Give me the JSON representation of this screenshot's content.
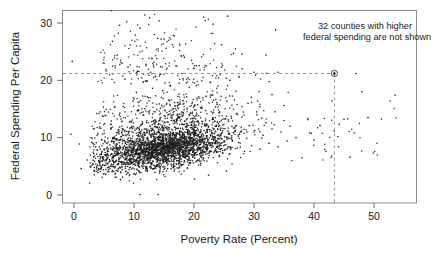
{
  "chart_data": {
    "type": "scatter",
    "title": "",
    "xlabel": "Poverty Rate (Percent)",
    "ylabel": "Federal Spending Per Capita",
    "xlim": [
      -2.0,
      57.2
    ],
    "ylim": [
      -1.4,
      33.6
    ],
    "xticks": [
      0,
      10,
      20,
      30,
      40,
      50
    ],
    "xtick_labels": [
      "0",
      "10",
      "20",
      "30",
      "40",
      "50"
    ],
    "yticks": [
      0,
      10,
      20,
      30
    ],
    "ytick_labels": [
      "0",
      "10",
      "20",
      "30"
    ],
    "grid": false,
    "legend": null,
    "annotations": [
      {
        "name": "truncation-note",
        "lines": [
          "32 counties with higher",
          "federal spending are not shown"
        ],
        "x": 33.0,
        "y": 31.5,
        "align": "left"
      }
    ],
    "reference_lines": [
      {
        "name": "horizontal-reference",
        "orientation": "horizontal",
        "value": 21.2,
        "style": "dashed",
        "from_x": -2.0,
        "to_x": 43.4
      },
      {
        "name": "vertical-reference",
        "orientation": "vertical",
        "value": 43.4,
        "style": "dashed",
        "from_y": -1.4,
        "to_y": 21.2
      }
    ],
    "highlighted_point": {
      "name": "circled-county",
      "x": 43.4,
      "y": 21.2,
      "marker": "circled-dot"
    },
    "marker": {
      "shape": "dot",
      "size_px": 1.6,
      "color": "#1c1c1c"
    },
    "n_points_shown": 3050,
    "points": [
      [
        -0.3,
        23.3
      ],
      [
        -0.5,
        10.6
      ],
      [
        0.9,
        8.9
      ],
      [
        1.2,
        4.6
      ],
      [
        2.2,
        6.1
      ],
      [
        2.6,
        2.1
      ],
      [
        3.1,
        5.4
      ],
      [
        3.3,
        7.2
      ],
      [
        3.4,
        4.2
      ],
      [
        3.6,
        6.4
      ],
      [
        3.7,
        9.1
      ],
      [
        3.8,
        5.0
      ],
      [
        3.9,
        7.8
      ],
      [
        4.0,
        3.9
      ],
      [
        4.1,
        6.0
      ],
      [
        4.2,
        8.4
      ],
      [
        4.3,
        5.6
      ],
      [
        4.4,
        4.1
      ],
      [
        4.5,
        7.0
      ],
      [
        4.6,
        9.6
      ],
      [
        4.7,
        5.9
      ],
      [
        4.8,
        6.6
      ],
      [
        4.9,
        4.4
      ],
      [
        5.0,
        8.0
      ],
      [
        5.1,
        5.2
      ],
      [
        5.2,
        7.4
      ],
      [
        5.3,
        3.6
      ],
      [
        5.4,
        6.8
      ],
      [
        5.5,
        9.0
      ],
      [
        5.6,
        5.5
      ],
      [
        5.7,
        7.6
      ],
      [
        5.8,
        4.8
      ],
      [
        5.9,
        6.2
      ],
      [
        6.0,
        8.7
      ],
      [
        6.1,
        5.1
      ],
      [
        6.2,
        7.1
      ],
      [
        6.3,
        9.4
      ],
      [
        6.4,
        4.3
      ],
      [
        6.5,
        6.5
      ],
      [
        6.6,
        8.1
      ],
      [
        6.7,
        5.7
      ],
      [
        6.8,
        7.3
      ],
      [
        6.9,
        3.8
      ],
      [
        7.0,
        6.9
      ],
      [
        7.1,
        9.8
      ],
      [
        7.2,
        5.3
      ],
      [
        7.3,
        7.9
      ],
      [
        7.4,
        4.6
      ],
      [
        7.5,
        6.3
      ],
      [
        7.6,
        8.6
      ],
      [
        7.7,
        5.8
      ],
      [
        7.8,
        7.5
      ],
      [
        7.9,
        10.2
      ],
      [
        8.0,
        4.9
      ],
      [
        8.1,
        6.7
      ],
      [
        8.2,
        8.3
      ],
      [
        8.3,
        5.4
      ],
      [
        8.4,
        7.2
      ],
      [
        8.5,
        9.2
      ],
      [
        8.6,
        4.1
      ],
      [
        8.7,
        6.1
      ],
      [
        8.8,
        8.8
      ],
      [
        8.9,
        5.6
      ],
      [
        9.0,
        7.7
      ],
      [
        9.1,
        10.8
      ],
      [
        9.2,
        4.4
      ],
      [
        9.3,
        6.4
      ],
      [
        9.4,
        8.2
      ],
      [
        9.5,
        5.9
      ],
      [
        9.6,
        7.0
      ],
      [
        9.7,
        9.5
      ],
      [
        9.8,
        4.7
      ],
      [
        9.9,
        6.6
      ],
      [
        10.0,
        8.5
      ],
      [
        10.2,
        5.2
      ],
      [
        10.4,
        7.4
      ],
      [
        10.6,
        9.9
      ],
      [
        10.8,
        4.2
      ],
      [
        11.0,
        6.8
      ],
      [
        11.2,
        8.0
      ],
      [
        11.4,
        5.5
      ],
      [
        11.6,
        7.6
      ],
      [
        11.8,
        10.4
      ],
      [
        12.0,
        4.8
      ],
      [
        12.2,
        6.2
      ],
      [
        12.4,
        8.9
      ],
      [
        12.6,
        5.7
      ],
      [
        12.8,
        7.1
      ],
      [
        13.0,
        9.3
      ],
      [
        13.2,
        4.5
      ],
      [
        13.4,
        6.5
      ],
      [
        13.6,
        8.4
      ],
      [
        13.8,
        5.1
      ],
      [
        14.0,
        7.8
      ],
      [
        14.2,
        10.1
      ],
      [
        14.4,
        4.9
      ],
      [
        14.6,
        6.9
      ],
      [
        14.8,
        8.6
      ],
      [
        15.0,
        5.8
      ],
      [
        15.2,
        7.3
      ],
      [
        15.4,
        9.7
      ],
      [
        15.6,
        4.6
      ],
      [
        15.8,
        6.3
      ],
      [
        16.0,
        8.1
      ],
      [
        16.2,
        5.4
      ],
      [
        16.4,
        7.9
      ],
      [
        16.6,
        10.6
      ],
      [
        16.8,
        5.0
      ],
      [
        17.0,
        7.2
      ],
      [
        17.2,
        9.1
      ],
      [
        17.4,
        6.0
      ],
      [
        17.6,
        8.3
      ],
      [
        17.8,
        11.0
      ],
      [
        18.0,
        5.3
      ],
      [
        18.2,
        7.5
      ],
      [
        18.4,
        9.4
      ],
      [
        18.6,
        6.4
      ],
      [
        18.8,
        8.7
      ],
      [
        19.0,
        11.4
      ],
      [
        19.2,
        5.6
      ],
      [
        19.4,
        7.7
      ],
      [
        19.6,
        9.8
      ],
      [
        19.8,
        6.7
      ],
      [
        20.0,
        8.9
      ],
      [
        20.3,
        11.8
      ],
      [
        20.6,
        6.1
      ],
      [
        20.9,
        8.2
      ],
      [
        21.2,
        10.3
      ],
      [
        21.5,
        7.0
      ],
      [
        21.8,
        9.2
      ],
      [
        22.1,
        12.2
      ],
      [
        22.4,
        6.5
      ],
      [
        22.7,
        8.6
      ],
      [
        23.0,
        10.8
      ],
      [
        23.3,
        7.4
      ],
      [
        23.6,
        9.6
      ],
      [
        23.9,
        12.7
      ],
      [
        24.2,
        6.9
      ],
      [
        24.5,
        9.0
      ],
      [
        24.8,
        11.2
      ],
      [
        25.1,
        7.8
      ],
      [
        25.4,
        10.1
      ],
      [
        25.7,
        13.1
      ],
      [
        26.0,
        7.2
      ],
      [
        26.4,
        9.5
      ],
      [
        26.8,
        11.7
      ],
      [
        27.2,
        8.2
      ],
      [
        27.6,
        10.6
      ],
      [
        28.0,
        13.6
      ],
      [
        28.4,
        7.6
      ],
      [
        28.8,
        9.9
      ],
      [
        29.2,
        12.1
      ],
      [
        29.6,
        8.6
      ],
      [
        30.0,
        11.0
      ],
      [
        30.5,
        14.0
      ],
      [
        31.0,
        8.0
      ],
      [
        31.5,
        10.4
      ],
      [
        32.0,
        12.6
      ],
      [
        32.5,
        9.0
      ],
      [
        33.0,
        11.5
      ],
      [
        33.5,
        14.5
      ],
      [
        34.0,
        8.4
      ],
      [
        34.5,
        11.0
      ],
      [
        35.0,
        13.0
      ],
      [
        35.5,
        9.4
      ],
      [
        36.0,
        12.0
      ],
      [
        37.0,
        10.0
      ],
      [
        38.0,
        6.5
      ],
      [
        39.0,
        13.3
      ],
      [
        40.0,
        9.6
      ],
      [
        41.0,
        12.1
      ],
      [
        42.0,
        7.6
      ],
      [
        43.0,
        16.4
      ],
      [
        43.4,
        21.2
      ],
      [
        44.0,
        10.2
      ],
      [
        45.0,
        13.2
      ],
      [
        46.0,
        6.6
      ],
      [
        47.0,
        21.2
      ],
      [
        48.0,
        18.0
      ],
      [
        49.0,
        13.5
      ],
      [
        53.5,
        17.4
      ],
      [
        11.0,
        0.1
      ],
      [
        14.0,
        0.1
      ],
      [
        8.5,
        20.2
      ],
      [
        9.5,
        19.4
      ],
      [
        12.2,
        19.9
      ],
      [
        13.1,
        18.6
      ],
      [
        10.4,
        17.9
      ],
      [
        14.8,
        18.2
      ],
      [
        16.0,
        19.1
      ],
      [
        17.5,
        17.6
      ],
      [
        19.2,
        18.8
      ],
      [
        20.5,
        16.9
      ],
      [
        22.0,
        17.2
      ],
      [
        24.0,
        19.0
      ],
      [
        25.5,
        16.4
      ],
      [
        27.0,
        18.1
      ],
      [
        29.0,
        16.0
      ],
      [
        31.0,
        15.4
      ],
      [
        33.0,
        17.5
      ],
      [
        35.0,
        15.6
      ],
      [
        7.6,
        29.6
      ],
      [
        8.8,
        30.2
      ],
      [
        9.4,
        28.6
      ],
      [
        10.2,
        27.9
      ],
      [
        11.0,
        29.1
      ],
      [
        11.8,
        31.4
      ],
      [
        12.6,
        30.9
      ],
      [
        13.4,
        28.0
      ],
      [
        14.2,
        30.4
      ],
      [
        15.0,
        27.2
      ],
      [
        16.4,
        26.2
      ],
      [
        17.6,
        25.2
      ],
      [
        18.4,
        24.0
      ],
      [
        19.6,
        23.5
      ],
      [
        20.4,
        22.6
      ],
      [
        21.6,
        31.0
      ],
      [
        22.4,
        30.6
      ],
      [
        23.2,
        29.8
      ],
      [
        24.6,
        26.2
      ],
      [
        25.6,
        31.2
      ],
      [
        26.6,
        24.7
      ],
      [
        28.0,
        22.0
      ],
      [
        30.0,
        21.4
      ],
      [
        32.0,
        24.4
      ],
      [
        33.6,
        28.8
      ],
      [
        34.0,
        21.4
      ],
      [
        6.4,
        26.8
      ],
      [
        7.2,
        24.4
      ],
      [
        8.0,
        23.0
      ],
      [
        9.0,
        22.3
      ],
      [
        10.6,
        21.6
      ],
      [
        12.0,
        22.8
      ],
      [
        13.8,
        23.8
      ],
      [
        15.4,
        21.9
      ],
      [
        18.0,
        21.2
      ],
      [
        19.0,
        20.4
      ],
      [
        21.0,
        21.8
      ],
      [
        23.8,
        20.8
      ],
      [
        26.0,
        20.0
      ]
    ]
  },
  "axes": {
    "x_title": "Poverty Rate (Percent)",
    "y_title": "Federal Spending Per Capita"
  },
  "note": {
    "line1": "32 counties with higher",
    "line2": "federal spending are not shown"
  },
  "ticks": {
    "x": [
      "0",
      "10",
      "20",
      "30",
      "40",
      "50"
    ],
    "y": [
      "0",
      "10",
      "20",
      "30"
    ]
  },
  "colors": {
    "point": "#1c1c1c",
    "frame": "#8c8c8c",
    "dash": "#8a8a8a",
    "text": "#1a1a1a",
    "background": "#ffffff"
  }
}
